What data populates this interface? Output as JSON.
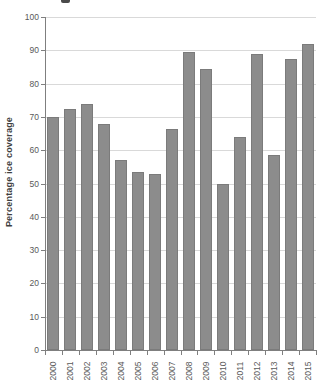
{
  "figure": {
    "y_axis_label": "Percentage ice coverage"
  },
  "chart_data": {
    "type": "bar",
    "title": "",
    "xlabel": "",
    "ylabel": "Percentage ice coverage",
    "categories": [
      "2000",
      "2001",
      "2002",
      "2003",
      "2004",
      "2005",
      "2006",
      "2007",
      "2008",
      "2009",
      "2010",
      "2011",
      "2012",
      "2013",
      "2014",
      "2015"
    ],
    "values": [
      70,
      72.5,
      74,
      68,
      57,
      53.5,
      53,
      66.5,
      89.5,
      84.5,
      50,
      64,
      89,
      58.5,
      87.5,
      92
    ],
    "ylim": [
      0,
      100
    ],
    "yticks": [
      0,
      10,
      20,
      30,
      40,
      50,
      60,
      70,
      80,
      90,
      100
    ],
    "grid": true,
    "legend": "none",
    "bar_color": "#8c8c8c",
    "gridline_color": "#d9d9d9",
    "axis_color": "#7f7f7f",
    "tick_label_color": "#595959"
  }
}
